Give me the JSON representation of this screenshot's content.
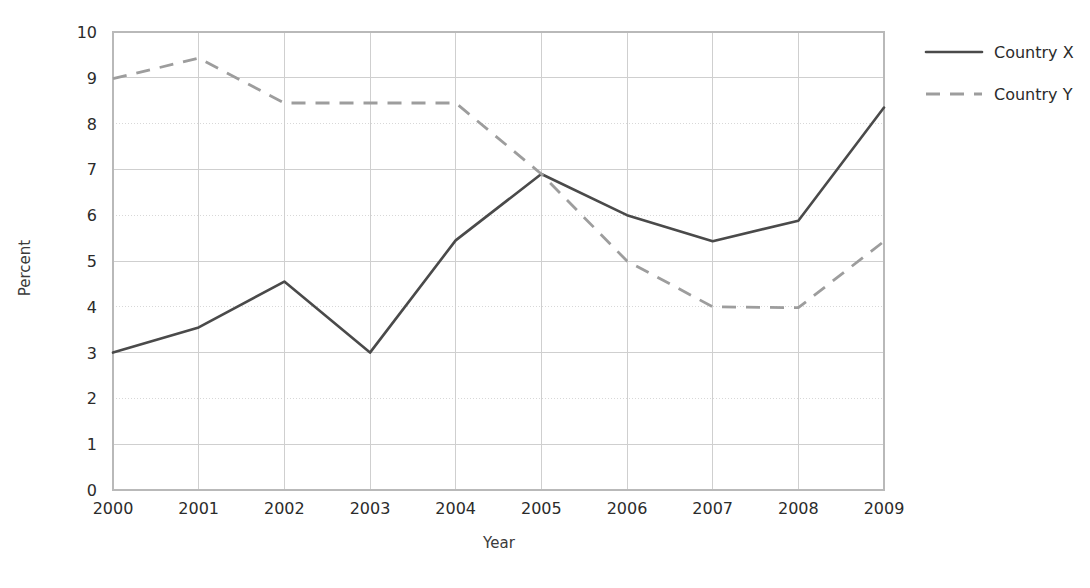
{
  "chart_data": {
    "type": "line",
    "title": "",
    "xlabel": "Year",
    "ylabel": "Percent",
    "categories": [
      "2000",
      "2001",
      "2002",
      "2003",
      "2004",
      "2005",
      "2006",
      "2007",
      "2008",
      "2009"
    ],
    "x": [
      2000,
      2001,
      2002,
      2003,
      2004,
      2005,
      2006,
      2007,
      2008,
      2009
    ],
    "xlim": [
      2000,
      2009
    ],
    "ylim": [
      0,
      10
    ],
    "yticks": [
      0,
      1,
      2,
      3,
      4,
      5,
      6,
      7,
      8,
      9,
      10
    ],
    "ytick_labels": [
      "0",
      "1",
      "2",
      "3",
      "4",
      "5",
      "6",
      "7",
      "8",
      "9",
      "10"
    ],
    "grid": true,
    "legend_position": "top-right",
    "series": [
      {
        "name": "Country X",
        "style": "solid",
        "color": "#4a4a4a",
        "values": [
          3.0,
          3.55,
          4.55,
          3.0,
          5.45,
          6.9,
          6.0,
          5.43,
          5.88,
          8.35
        ]
      },
      {
        "name": "Country Y",
        "style": "dashed",
        "color": "#9d9d9d",
        "values": [
          8.98,
          9.43,
          8.45,
          8.45,
          8.45,
          6.9,
          5.0,
          4.0,
          3.98,
          5.43
        ]
      }
    ]
  },
  "axes": {
    "y_title": "Percent",
    "x_title": "Year"
  },
  "legend": {
    "items": [
      {
        "label": "Country X",
        "style": "solid"
      },
      {
        "label": "Country Y",
        "style": "dashed"
      }
    ]
  }
}
